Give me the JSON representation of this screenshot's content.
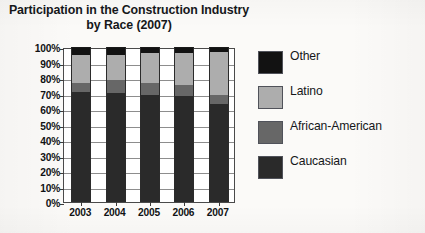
{
  "chart_data": {
    "type": "bar",
    "subtype": "stacked-percent",
    "title": "Participation in the Construction Industry by Race (2007)",
    "title_lines": [
      "Participation in the Construction Industry",
      "by Race (2007)"
    ],
    "categories": [
      "2003",
      "2004",
      "2005",
      "2006",
      "2007"
    ],
    "xlabel": "",
    "ylabel": "",
    "ylim": [
      0,
      100
    ],
    "y_ticks": [
      0,
      10,
      20,
      30,
      40,
      50,
      60,
      70,
      80,
      90,
      100
    ],
    "y_tick_labels": [
      "0%",
      "10%",
      "20%",
      "30%",
      "40%",
      "50%",
      "60%",
      "70%",
      "80%",
      "90%",
      "100%"
    ],
    "grid": true,
    "legend_position": "right",
    "stack_order_bottom_to_top": [
      "Caucasian",
      "African-American",
      "Latino",
      "Other"
    ],
    "series": [
      {
        "name": "Caucasian",
        "color": "#2a2a2a",
        "values": [
          71,
          70.5,
          69,
          68.5,
          63
        ]
      },
      {
        "name": "African-American",
        "color": "#676767",
        "values": [
          6,
          8.5,
          7.5,
          7,
          6
        ]
      },
      {
        "name": "Latino",
        "color": "#adadad",
        "values": [
          18,
          16,
          19.5,
          20.5,
          28
        ]
      },
      {
        "name": "Other",
        "color": "#121212",
        "values": [
          5,
          5,
          4,
          4,
          3
        ]
      }
    ],
    "legend_entries": [
      {
        "label": "Other",
        "color": "#121212"
      },
      {
        "label": "Latino",
        "color": "#adadad"
      },
      {
        "label": "African-American",
        "color": "#676767"
      },
      {
        "label": "Caucasian",
        "color": "#2a2a2a"
      }
    ]
  }
}
